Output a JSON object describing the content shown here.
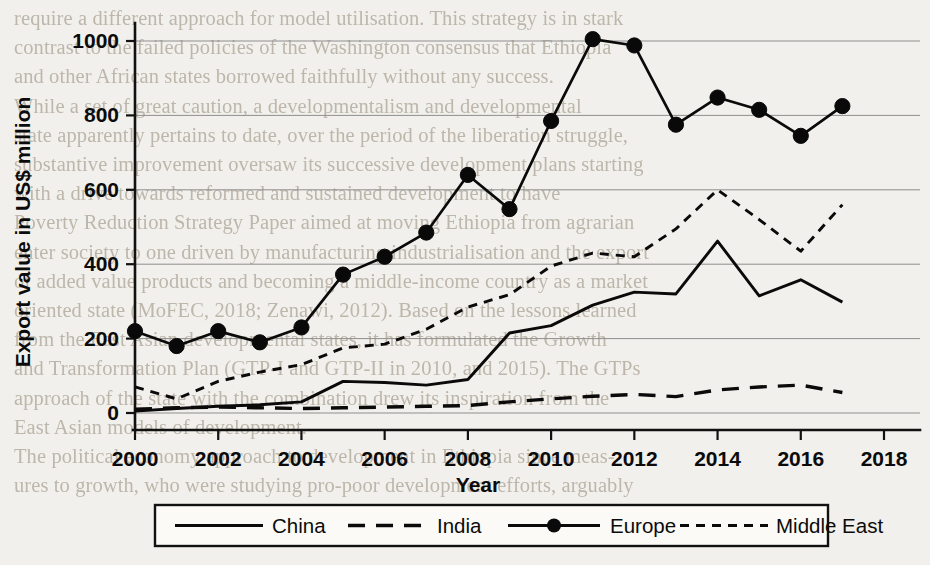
{
  "page": {
    "background_color": "#f2f0ec",
    "ink_color": "#0b0b0b",
    "bleed_color": "#b9b2a6",
    "bleed_text": [
      "require a different approach for model utilisation. This strategy is in stark",
      "contrast to the failed policies of the Washington consensus that Ethiopia",
      "and other African states borrowed faithfully without any success.",
      "    While a set of great caution, a developmentalism and developmental",
      "state apparently pertains to date, over the period of the liberation struggle,",
      "substantive improvement oversaw its successive development plans starting",
      "with a drive towards reformed and sustained development to have",
      "Poverty Reduction Strategy Paper aimed at moving Ethiopia from agrarian",
      "enter society to one driven by manufacturing industrialisation and the export",
      "of added value products and becoming a middle-income country as a market",
      "oriented state (MoFEC, 2018; Zenawi, 2012). Based on the lessons learned",
      "from the East Asian developmental states, it has formulated the Growth",
      "and Transformation Plan (GTP-I and GTP-II in 2010, and 2015). The GTPs",
      "approach of the state with the combination drew its inspiration from the",
      "East Asian models of development.",
      "    The political economy approach to development in Ethiopia since meas-",
      "ures to growth, who were studying pro-poor development efforts, arguably"
    ]
  },
  "chart_data": {
    "type": "line",
    "title": "",
    "xlabel": "Year",
    "ylabel": "Export value in US$ million",
    "xlim": [
      2000,
      2018
    ],
    "ylim": [
      0,
      1000
    ],
    "xticks": [
      2000,
      2002,
      2004,
      2006,
      2008,
      2010,
      2012,
      2014,
      2016,
      2018
    ],
    "yticks": [
      0,
      200,
      400,
      600,
      800,
      1000
    ],
    "grid": "horizontal",
    "legend_position": "below-axis",
    "x": [
      2000,
      2001,
      2002,
      2003,
      2004,
      2005,
      2006,
      2007,
      2008,
      2009,
      2010,
      2011,
      2012,
      2013,
      2014,
      2015,
      2016,
      2017
    ],
    "series": [
      {
        "name": "China",
        "style": "solid",
        "marker": "none",
        "color": "#0a0a0a",
        "values": [
          5,
          12,
          18,
          22,
          30,
          85,
          82,
          75,
          90,
          215,
          235,
          290,
          325,
          320,
          462,
          315,
          358,
          298
        ]
      },
      {
        "name": "India",
        "style": "dashed",
        "marker": "none",
        "color": "#0a0a0a",
        "values": [
          10,
          14,
          16,
          14,
          12,
          14,
          16,
          18,
          20,
          30,
          38,
          45,
          50,
          44,
          62,
          70,
          75,
          55
        ]
      },
      {
        "name": "Europe",
        "style": "solid",
        "marker": "circle",
        "color": "#0a0a0a",
        "values": [
          220,
          180,
          220,
          190,
          230,
          372,
          420,
          485,
          640,
          548,
          785,
          1005,
          988,
          775,
          848,
          815,
          745,
          825
        ]
      },
      {
        "name": "Middle East",
        "style": "dotted",
        "marker": "none",
        "color": "#0a0a0a",
        "values": [
          70,
          38,
          85,
          110,
          130,
          175,
          185,
          225,
          285,
          318,
          395,
          430,
          420,
          495,
          600,
          520,
          435,
          560
        ]
      }
    ]
  },
  "legend": {
    "items": [
      {
        "label": "China",
        "style": "solid",
        "marker": "none"
      },
      {
        "label": "India",
        "style": "dashed",
        "marker": "none"
      },
      {
        "label": "Europe",
        "style": "solid",
        "marker": "circle"
      },
      {
        "label": "Middle East",
        "style": "dotted",
        "marker": "none"
      }
    ]
  }
}
